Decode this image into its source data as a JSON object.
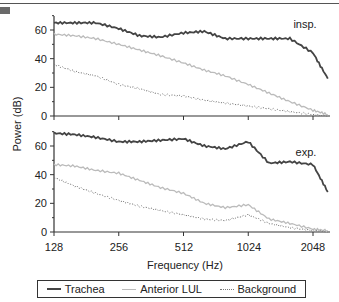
{
  "chart_data": [
    {
      "type": "line",
      "panel_label": "insp.",
      "xscale": "log2",
      "x_ticks": [
        128,
        256,
        512,
        1024,
        2048
      ],
      "ylim": [
        0,
        70
      ],
      "y_ticks": [
        0,
        20,
        40,
        60
      ],
      "ylabel": "Power (dB)",
      "xlabel": "Frequency (Hz)",
      "x": [
        128,
        160,
        200,
        256,
        320,
        400,
        512,
        640,
        800,
        1024,
        1280,
        1600,
        2048,
        2400
      ],
      "series": [
        {
          "name": "Trachea",
          "values": [
            65,
            65,
            65,
            61,
            56,
            55,
            58,
            59,
            54,
            54,
            54,
            54,
            44,
            26
          ]
        },
        {
          "name": "Anterior LUL",
          "values": [
            57,
            56,
            54,
            50,
            46,
            42,
            37,
            32,
            28,
            22,
            16,
            10,
            4,
            1
          ]
        },
        {
          "name": "Background",
          "values": [
            36,
            31,
            28,
            22,
            19,
            15,
            14,
            11,
            9,
            7,
            5,
            3,
            1,
            0
          ]
        }
      ]
    },
    {
      "type": "line",
      "panel_label": "exp.",
      "xscale": "log2",
      "x_ticks": [
        128,
        256,
        512,
        1024,
        2048
      ],
      "ylim": [
        0,
        70
      ],
      "y_ticks": [
        0,
        20,
        40,
        60
      ],
      "ylabel": "Power (dB)",
      "xlabel": "Frequency (Hz)",
      "x": [
        128,
        160,
        200,
        256,
        320,
        400,
        512,
        640,
        800,
        1024,
        1280,
        1600,
        2048,
        2400
      ],
      "series": [
        {
          "name": "Trachea",
          "values": [
            69,
            68,
            66,
            63,
            63,
            64,
            65,
            60,
            58,
            63,
            48,
            49,
            47,
            28
          ]
        },
        {
          "name": "Anterior LUL",
          "values": [
            47,
            46,
            43,
            41,
            36,
            31,
            27,
            20,
            17,
            19,
            9,
            6,
            2,
            1
          ]
        },
        {
          "name": "Background",
          "values": [
            38,
            32,
            27,
            22,
            18,
            15,
            12,
            9,
            8,
            12,
            6,
            3,
            1,
            0
          ]
        }
      ]
    }
  ],
  "axes": {
    "ylabel": "Power (dB)",
    "xlabel": "Frequency (Hz)",
    "x_tick_labels": [
      "128",
      "256",
      "512",
      "1024",
      "2048"
    ],
    "y_tick_labels": [
      "0",
      "20",
      "40",
      "60"
    ]
  },
  "panels": {
    "top": {
      "label": "insp."
    },
    "bottom": {
      "label": "exp."
    }
  },
  "legend": {
    "items": [
      {
        "label": "Trachea",
        "style": "solid-dark"
      },
      {
        "label": "Anterior LUL",
        "style": "solid-light"
      },
      {
        "label": "Background",
        "style": "dotted"
      }
    ]
  },
  "colors": {
    "trachea": "#444444",
    "anterior_lul": "#bbbbbb",
    "background": "#777777",
    "axis": "#333333"
  }
}
